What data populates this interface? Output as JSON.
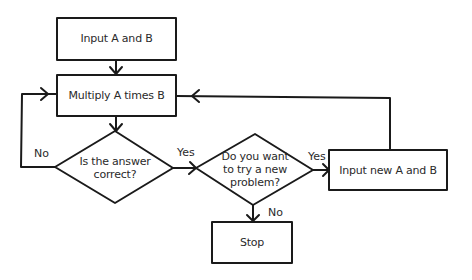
{
  "diagram": {
    "type": "flowchart",
    "nodes": {
      "input": {
        "shape": "rectangle",
        "label": "Input A and B"
      },
      "multiply": {
        "shape": "rectangle",
        "label": "Multiply A times B"
      },
      "check": {
        "shape": "diamond",
        "label_lines": [
          "Is the answer",
          "correct?"
        ]
      },
      "again": {
        "shape": "diamond",
        "label_lines": [
          "Do you want",
          "to try a new",
          "problem?"
        ]
      },
      "new_input": {
        "shape": "rectangle",
        "label": "Input new A and B"
      },
      "stop": {
        "shape": "rectangle",
        "label": "Stop"
      }
    },
    "edges": {
      "input_to_multiply": {
        "from": "input",
        "to": "multiply",
        "label": ""
      },
      "multiply_to_check": {
        "from": "multiply",
        "to": "check",
        "label": ""
      },
      "check_no": {
        "from": "check",
        "to": "multiply",
        "label": "No"
      },
      "check_yes": {
        "from": "check",
        "to": "again",
        "label": "Yes"
      },
      "again_yes": {
        "from": "again",
        "to": "new_input",
        "label": "Yes"
      },
      "again_no": {
        "from": "again",
        "to": "stop",
        "label": "No"
      },
      "new_input_to_multiply": {
        "from": "new_input",
        "to": "multiply",
        "label": ""
      }
    },
    "colors": {
      "stroke": "#1a1a1a",
      "text": "#2a2a2a",
      "background": "#ffffff"
    }
  }
}
